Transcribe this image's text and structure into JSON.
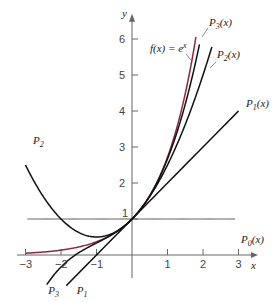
{
  "chart_data": {
    "type": "line",
    "title": "",
    "xlabel": "x",
    "ylabel": "y",
    "xlim": [
      -3,
      3
    ],
    "ylim": [
      0,
      6
    ],
    "grid": false,
    "x_ticks": [
      "-3",
      "-2",
      "-1",
      "1",
      "2",
      "3"
    ],
    "y_ticks": [
      "1",
      "2",
      "3",
      "4",
      "5",
      "6"
    ],
    "series": [
      {
        "name": "f(x) = e^x",
        "label": "f(x) = e",
        "label_sup": "x",
        "color": "#8b2a3c",
        "formula": "exp",
        "x_range": [
          -3,
          1.8
        ]
      },
      {
        "name": "P0(x)",
        "label": "P",
        "sub": "0",
        "suffix": "(x)",
        "color": "#555555",
        "formula": "1",
        "x_range": [
          -2.95,
          2.9
        ]
      },
      {
        "name": "P1(x)",
        "label": "P",
        "sub": "1",
        "suffix": "(x)",
        "color": "#111111",
        "formula": "1+x",
        "x_range": [
          -1.85,
          3.0
        ]
      },
      {
        "name": "P2(x)",
        "label": "P",
        "sub": "2",
        "suffix": "(x)",
        "color": "#111111",
        "formula": "1+x+x^2/2",
        "x_range": [
          -3.0,
          2.25
        ]
      },
      {
        "name": "P3(x)",
        "label": "P",
        "sub": "3",
        "suffix": "(x)",
        "color": "#111111",
        "formula": "1+x+x^2/2+x^3/6",
        "x_range": [
          -2.4,
          1.9
        ]
      }
    ],
    "annotations": [
      {
        "text": "P",
        "sub": "2",
        "x": -2.9,
        "y": 2.7
      },
      {
        "text": "P",
        "sub": "3",
        "x": -2.3,
        "y": -0.7
      },
      {
        "text": "P",
        "sub": "1",
        "x": -1.5,
        "y": -0.7
      }
    ]
  }
}
